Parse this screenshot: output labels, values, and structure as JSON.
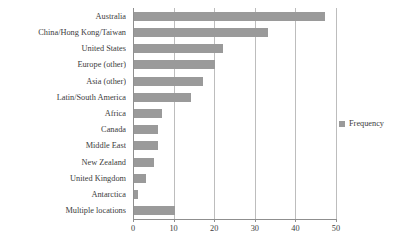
{
  "chart_data": {
    "type": "bar",
    "orientation": "horizontal",
    "title": "",
    "xlabel": "",
    "ylabel": "",
    "categories": [
      "Australia",
      "China/Hong Kong/Taiwan",
      "United States",
      "Europe (other)",
      "Asia (other)",
      "Latin/South America",
      "Africa",
      "Canada",
      "Middle East",
      "New Zealand",
      "United Kingdom",
      "Antarctica",
      "Multiple locations"
    ],
    "values": [
      47,
      33,
      22,
      20,
      17,
      14,
      7,
      6,
      6,
      5,
      3,
      1,
      10
    ],
    "series": [
      {
        "name": "Frequency",
        "values": [
          47,
          33,
          22,
          20,
          17,
          14,
          7,
          6,
          6,
          5,
          3,
          1,
          10
        ],
        "color": "#9a9a9a"
      }
    ],
    "xlim": [
      0,
      50
    ],
    "xticks": [
      0,
      10,
      20,
      30,
      40,
      50
    ],
    "xticklabels": [
      "0",
      "10",
      "20",
      "30",
      "40",
      "50"
    ],
    "grid": "vertical",
    "legend": {
      "entries": [
        "Frequency"
      ],
      "position": "right"
    }
  },
  "legend": {
    "label": "Frequency",
    "swatch_color": "#9a9a9a"
  },
  "axis": {
    "grid_color": "#bdbdbd",
    "line_color": "#8f8f8f"
  }
}
